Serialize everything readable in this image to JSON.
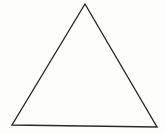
{
  "canvas": {
    "width": 165,
    "height": 134,
    "background_color": "#fdfdfb"
  },
  "figure": {
    "name": "triangle",
    "shape_type": "triangle",
    "fill": "none",
    "fill_color": "#ffffff",
    "stroke_color": "#2b2b2b",
    "stroke_width": 1.4,
    "closed": true,
    "vertex_count": 3,
    "vertices": [
      {
        "label": "apex",
        "x": 85,
        "y": 4
      },
      {
        "label": "bottom-left",
        "x": 12,
        "y": 125
      },
      {
        "label": "bottom-right",
        "x": 157,
        "y": 127
      }
    ],
    "points_attr": "85,4 12,125 157,127",
    "edges": [
      {
        "name": "left-edge",
        "from": "apex",
        "to": "bottom-left"
      },
      {
        "name": "base-edge",
        "from": "bottom-left",
        "to": "bottom-right"
      },
      {
        "name": "right-edge",
        "from": "bottom-right",
        "to": "apex"
      }
    ]
  },
  "labels": {
    "text_items": []
  }
}
